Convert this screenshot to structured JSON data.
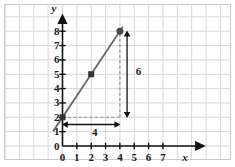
{
  "chart_data": {
    "type": "line",
    "title": "",
    "xlabel": "x",
    "ylabel": "y",
    "xlim": [
      -1.05,
      8.6
    ],
    "ylim": [
      -0.85,
      8.9
    ],
    "grid": true,
    "legend": "none",
    "x_ticks": [
      "0",
      "1",
      "2",
      "3",
      "4",
      "5",
      "6",
      "7"
    ],
    "x_tick_values": [
      0,
      1,
      2,
      3,
      4,
      5,
      6,
      7
    ],
    "y_ticks": [
      "0",
      "1",
      "2",
      "3",
      "4",
      "5",
      "6",
      "7",
      "8"
    ],
    "y_tick_values": [
      0,
      1,
      2,
      3,
      4,
      5,
      6,
      7,
      8
    ],
    "series": [
      {
        "name": "line",
        "type": "line",
        "slope": 1.5,
        "intercept": 2,
        "x": [
          -0.62,
          4.18
        ],
        "y": [
          1.07,
          8.27
        ],
        "color": "#6f6f6f"
      }
    ],
    "points": [
      {
        "x": 0,
        "y": 2,
        "marker": "square",
        "color": "#333333"
      },
      {
        "x": 2,
        "y": 5,
        "marker": "square",
        "color": "#333333"
      },
      {
        "x": 4,
        "y": 8,
        "marker": "circle",
        "color": "#4a4a4a"
      }
    ],
    "guides": [
      {
        "name": "vertical-dashed",
        "x": 4,
        "y_from": 2,
        "y_to": 8,
        "style": "dashed",
        "color": "#8a8a8a"
      },
      {
        "name": "horizontal-dashed",
        "y": 2,
        "x_from": 0,
        "x_to": 4,
        "style": "dashed",
        "color": "#8a8a8a"
      }
    ],
    "annotations": [
      {
        "name": "rise-arrow",
        "label": "6",
        "orientation": "vertical",
        "x": 4.5,
        "from": 2,
        "to": 8,
        "label_x": 5.1,
        "label_y": 5.2
      },
      {
        "name": "run-arrow",
        "label": "4",
        "orientation": "horizontal",
        "y": 1.5,
        "from": 0,
        "to": 4,
        "label_x": 2.05,
        "label_y": 0.95
      }
    ],
    "colors": {
      "grid": "#d7d7dd",
      "frame": "#c9c9d0",
      "axis": "#111111",
      "line": "#6f6f6f",
      "dashed": "#8a8a8a",
      "text": "#1b1b1b",
      "background": "#ffffff"
    }
  },
  "axis_labels": {
    "x": "x",
    "y": "y"
  },
  "annotation_labels": {
    "rise": "6",
    "run": "4"
  }
}
